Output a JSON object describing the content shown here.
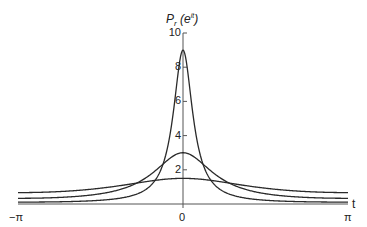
{
  "chart_data": {
    "type": "line",
    "title_parts": {
      "main": "P",
      "sub": "r",
      "open": " (e",
      "sup": "it",
      "close": ")"
    },
    "xlabel": "t",
    "ylabel": "P_r (e^{it})",
    "xlim": [
      -3.14159,
      3.14159
    ],
    "ylim": [
      0,
      10
    ],
    "x_ticks": [
      {
        "value": -3.14159,
        "label": "−π"
      },
      {
        "value": 0,
        "label": "0"
      },
      {
        "value": 3.14159,
        "label": "π"
      }
    ],
    "y_ticks": [
      {
        "value": 2,
        "label": "2"
      },
      {
        "value": 4,
        "label": "4"
      },
      {
        "value": 6,
        "label": "6"
      },
      {
        "value": 8,
        "label": "8"
      },
      {
        "value": 10,
        "label": "10"
      }
    ],
    "grid": false,
    "legend": null,
    "formula": "P_r(t) = (1 - r^2) / (1 - 2 r cos t + r^2)",
    "series": [
      {
        "name": "r = 0.2",
        "r": 0.2,
        "peak": 1.5,
        "value_at_pi": 0.667
      },
      {
        "name": "r = 0.5",
        "r": 0.5,
        "peak": 3.0,
        "value_at_pi": 0.333
      },
      {
        "name": "r = 0.8",
        "r": 0.8,
        "peak": 9.0,
        "value_at_pi": 0.111
      }
    ],
    "line_color": "#2a2a2a",
    "axis_color": "#555555"
  }
}
